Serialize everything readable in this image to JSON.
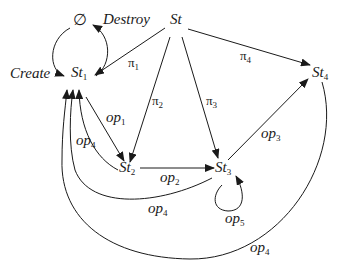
{
  "diagram": {
    "type": "state-transition",
    "nodes": {
      "empty": {
        "label": "∅"
      },
      "st": {
        "label": "St"
      },
      "st1": {
        "label": "St",
        "sub": "1"
      },
      "st2": {
        "label": "St",
        "sub": "2"
      },
      "st3": {
        "label": "St",
        "sub": "3"
      },
      "st4": {
        "label": "St",
        "sub": "4"
      }
    },
    "edges": {
      "create": {
        "label": "Create",
        "from": "∅",
        "to": "St1"
      },
      "destroy": {
        "label": "Destroy",
        "from": "St1",
        "to": "∅"
      },
      "pi1": {
        "label": "π",
        "sub": "1",
        "from": "St",
        "to": "St1"
      },
      "pi2": {
        "label": "π",
        "sub": "2",
        "from": "St",
        "to": "St2"
      },
      "pi3": {
        "label": "π",
        "sub": "3",
        "from": "St",
        "to": "St3"
      },
      "pi4": {
        "label": "π",
        "sub": "4",
        "from": "St",
        "to": "St4"
      },
      "op1": {
        "label": "op",
        "sub": "1",
        "from": "St1",
        "to": "St2"
      },
      "op2": {
        "label": "op",
        "sub": "2",
        "from": "St2",
        "to": "St3"
      },
      "op3": {
        "label": "op",
        "sub": "3",
        "from": "St3",
        "to": "St4"
      },
      "op4a": {
        "label": "op",
        "sub": "4",
        "from": "St2",
        "to": "St1"
      },
      "op4b": {
        "label": "op",
        "sub": "4",
        "from": "St3",
        "to": "St1"
      },
      "op4c": {
        "label": "op",
        "sub": "4",
        "from": "St4",
        "to": "St1"
      },
      "op5": {
        "label": "op",
        "sub": "5",
        "from": "St3",
        "to": "St3"
      }
    }
  }
}
